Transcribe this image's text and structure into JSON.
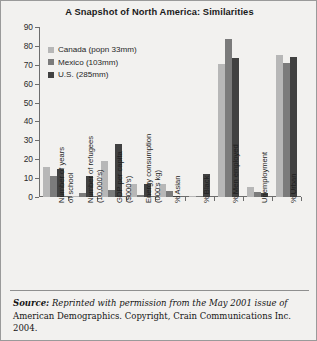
{
  "chart_data": {
    "type": "bar",
    "title": "A Snapshot of North America: Similarities",
    "xlabel": "",
    "ylabel": "",
    "ylim": [
      0,
      90
    ],
    "yticks": [
      0,
      10,
      20,
      30,
      40,
      50,
      60,
      70,
      80,
      90
    ],
    "grid": false,
    "legend_position": "upper-left",
    "categories": [
      "Number of years of school",
      "Number of refugees (10,000's)",
      "GDP per capita ($000's)",
      "Energy consumption (000's kg)",
      "% Asian",
      "% Black",
      "% Men employed",
      "Unemployment",
      "% Urban"
    ],
    "category_lines": [
      [
        "Number of years",
        "of school"
      ],
      [
        "Number of refugees",
        "(10,000's)"
      ],
      [
        "GDP per capita",
        "($000's)"
      ],
      [
        "Energy consumption",
        "(000's kg)"
      ],
      [
        "% Asian",
        ""
      ],
      [
        "% Black",
        ""
      ],
      [
        "% Men employed",
        ""
      ],
      [
        "Unemployment",
        ""
      ],
      [
        "% Urban",
        ""
      ]
    ],
    "series": [
      {
        "name": "Canada (popn 33mm)",
        "color": "#b7b7b7",
        "values": [
          16,
          0.5,
          19,
          7,
          7,
          0.8,
          70.5,
          5.5,
          75
        ]
      },
      {
        "name": "Mexico (103mm)",
        "color": "#7b7b7b",
        "values": [
          11,
          2,
          3.5,
          1,
          3,
          0.4,
          83.5,
          2.5,
          71
        ]
      },
      {
        "name": "U.S. (285mm)",
        "color": "#414141",
        "values": [
          15,
          11,
          28,
          7,
          0.8,
          12,
          73.5,
          2,
          74
        ]
      }
    ]
  },
  "source": {
    "label": "Source:",
    "italic_part": "Reprinted with permission from the May 2001 issue of",
    "rest_part": " American Demographics. Copyright, Crain Communications Inc. 2004."
  }
}
